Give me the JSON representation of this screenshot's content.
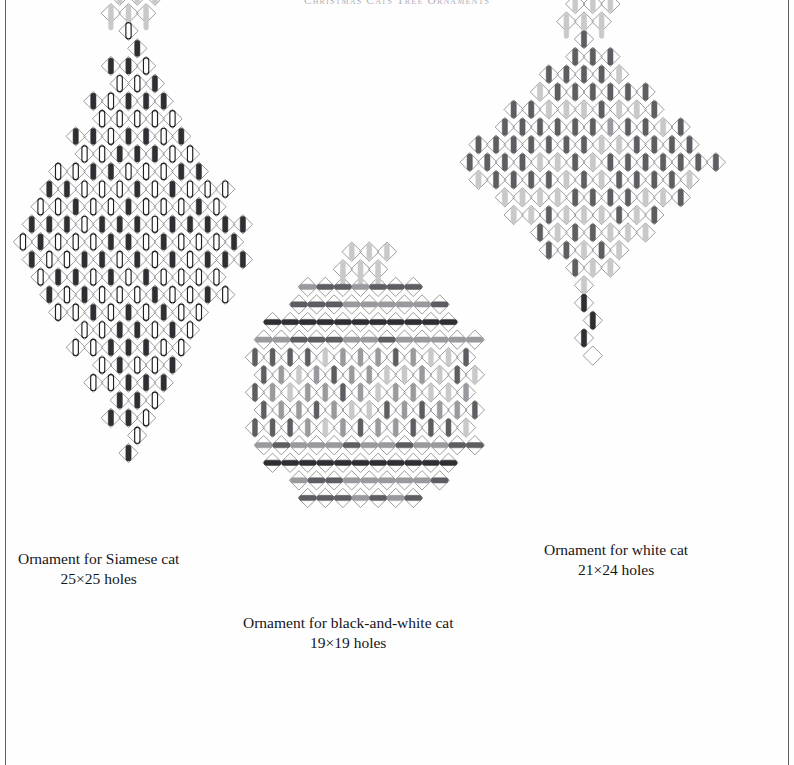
{
  "running_head": "Christmas Cats Tree Ornaments",
  "page": {
    "background": "#fefefe",
    "rule_color": "#3a3a3a",
    "width": 794,
    "height": 765
  },
  "palette": {
    "lattice": "#8a8a8a",
    "black_stitch": "#2f2f33",
    "white_stitch_fill": "#ffffff",
    "white_stitch_stroke": "#1f1f22",
    "dark_grey_stitch": "#5d5d62",
    "mid_grey_stitch": "#9a9a9e",
    "light_grey_stitch": "#c9c9cb"
  },
  "legend_keys": [
    {
      "name": "black",
      "color": "#2f2f33",
      "label": "black stitch"
    },
    {
      "name": "white",
      "color": "#ffffff",
      "label": "white stitch"
    },
    {
      "name": "dark",
      "color": "#5d5d62",
      "label": "dark grey stitch"
    },
    {
      "name": "mid",
      "color": "#9a9a9e",
      "label": "medium grey stitch"
    },
    {
      "name": "light",
      "color": "#c9c9cb",
      "label": "light grey stitch"
    }
  ],
  "ornaments": [
    {
      "id": "siamese",
      "caption_line1": "Ornament for Siamese cat",
      "caption_line2": "25×25 holes",
      "grid_label": "25×25",
      "holes_x": 25,
      "holes_y": 25,
      "shape": "rhombus",
      "body_width_cells": 13,
      "body_height_cells": 25,
      "finial": "crown",
      "finial_color": "light",
      "stitch_orientation": "vertical",
      "colors_used": [
        "black",
        "white",
        "light"
      ],
      "cell": 17.6,
      "position": {
        "x": 14,
        "y": 22
      },
      "caption_position": {
        "x": 18,
        "y": 549
      }
    },
    {
      "id": "black-and-white",
      "caption_line1": "Ornament for black-and-white cat",
      "caption_line2": "19×19 holes",
      "grid_label": "19×19",
      "holes_x": 19,
      "holes_y": 19,
      "shape": "octagon",
      "body_width_cells": 13,
      "body_height_cells": 13,
      "finial": "crown",
      "finial_color": "light",
      "stitch_orientation": "mixed",
      "colors_used": [
        "black",
        "dark",
        "mid",
        "light"
      ],
      "cell": 17.6,
      "position": {
        "x": 246,
        "y": 278
      },
      "caption_position": {
        "x": 243,
        "y": 613
      }
    },
    {
      "id": "white",
      "caption_line1": "Ornament for white cat",
      "caption_line2": "21×24 holes",
      "grid_label": "21×24",
      "holes_x": 21,
      "holes_y": 24,
      "shape": "diamond",
      "body_width_cells": 15,
      "body_height_cells": 15,
      "finial": "crown",
      "finial_color": "light",
      "tail": "pendant-drop",
      "stitch_orientation": "vertical",
      "colors_used": [
        "black",
        "dark",
        "light"
      ],
      "cell": 17.6,
      "position": {
        "x": 452,
        "y": 30
      },
      "caption_position": {
        "x": 544,
        "y": 540
      }
    }
  ],
  "chart_data": {
    "type": "table",
    "title": "Christmas Cats Tree Ornaments",
    "columns": [
      "Ornament",
      "Holes",
      "Outline shape",
      "Stitch tones"
    ],
    "rows": [
      [
        "Ornament for Siamese cat",
        "25×25 holes",
        "tall rhombus with crown finial",
        "black, white, light grey"
      ],
      [
        "Ornament for black-and-white cat",
        "19×19 holes",
        "octagon with crown finial",
        "black, dark grey, medium grey, light grey"
      ],
      [
        "Ornament for white cat",
        "21×24 holes",
        "diamond with crown finial and pendant drop",
        "black, dark grey, light grey"
      ]
    ],
    "legend": [
      "black stitch",
      "white stitch",
      "dark grey stitch",
      "medium grey stitch",
      "light grey stitch"
    ],
    "xlabel": "",
    "ylabel": "",
    "grid": true,
    "legend_position": "none"
  }
}
